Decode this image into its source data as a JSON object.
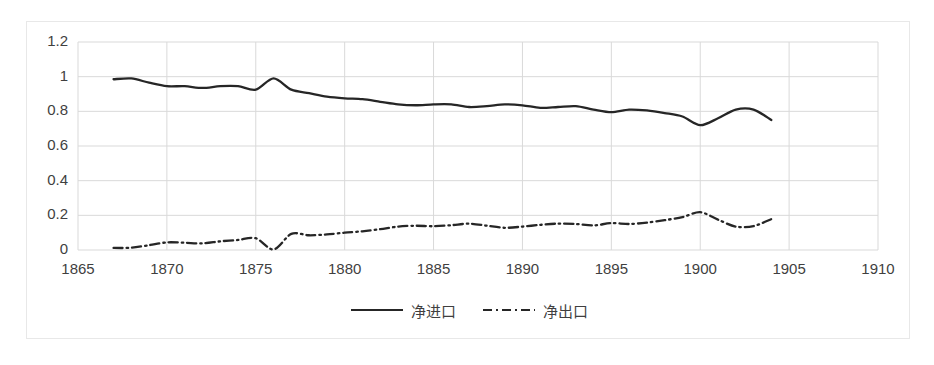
{
  "chart_data": {
    "type": "line",
    "title": "",
    "subtitle": "",
    "xlabel": "",
    "ylabel": "",
    "xlim": [
      1865,
      1910
    ],
    "ylim": [
      0,
      1.2
    ],
    "grid": true,
    "legend_position": "bottom",
    "x_ticks": [
      "1865",
      "1870",
      "1875",
      "1880",
      "1885",
      "1890",
      "1895",
      "1900",
      "1905",
      "1910"
    ],
    "y_ticks": [
      "0",
      "0.2",
      "0.4",
      "0.6",
      "0.8",
      "1",
      "1.2"
    ],
    "x": [
      1867,
      1868,
      1869,
      1870,
      1871,
      1872,
      1873,
      1874,
      1875,
      1876,
      1877,
      1878,
      1879,
      1880,
      1881,
      1882,
      1883,
      1884,
      1885,
      1886,
      1887,
      1888,
      1889,
      1890,
      1891,
      1892,
      1893,
      1894,
      1895,
      1896,
      1897,
      1898,
      1899,
      1900,
      1901,
      1902,
      1903,
      1904
    ],
    "series": [
      {
        "name": "净进口",
        "style": "solid",
        "color": "#262626",
        "values": [
          0.985,
          0.99,
          0.965,
          0.945,
          0.945,
          0.935,
          0.945,
          0.945,
          0.925,
          0.99,
          0.925,
          0.905,
          0.885,
          0.875,
          0.87,
          0.855,
          0.84,
          0.835,
          0.84,
          0.84,
          0.825,
          0.83,
          0.84,
          0.835,
          0.82,
          0.825,
          0.83,
          0.81,
          0.795,
          0.81,
          0.805,
          0.79,
          0.77,
          0.72,
          0.76,
          0.81,
          0.81,
          0.75
        ]
      },
      {
        "name": "净出口",
        "style": "dash-dot",
        "color": "#262626",
        "values": [
          0.012,
          0.013,
          0.028,
          0.044,
          0.042,
          0.038,
          0.05,
          0.058,
          0.068,
          0.003,
          0.093,
          0.085,
          0.09,
          0.1,
          0.108,
          0.12,
          0.135,
          0.14,
          0.137,
          0.143,
          0.152,
          0.14,
          0.128,
          0.135,
          0.145,
          0.152,
          0.15,
          0.142,
          0.155,
          0.15,
          0.158,
          0.172,
          0.19,
          0.218,
          0.175,
          0.135,
          0.138,
          0.178
        ]
      }
    ]
  },
  "legend": {
    "items": [
      {
        "label": "净进口",
        "style": "solid"
      },
      {
        "label": "净出口",
        "style": "dash-dot"
      }
    ]
  },
  "axes": {
    "y_tick_labels": [
      "1.2",
      "1",
      "0.8",
      "0.6",
      "0.4",
      "0.2",
      "0"
    ],
    "x_tick_labels": [
      "1865",
      "1870",
      "1875",
      "1880",
      "1885",
      "1890",
      "1895",
      "1900",
      "1905",
      "1910"
    ]
  },
  "colors": {
    "series": "#262626",
    "grid": "#d9d9d9",
    "text": "#3f3f3f",
    "frame": "#e8e8e8",
    "background": "#ffffff"
  }
}
